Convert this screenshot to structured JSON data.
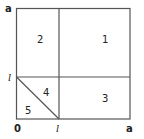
{
  "diagram": {
    "type": "partitioned-square",
    "colors": {
      "line": "#555555",
      "text": "#222222",
      "background": "#ffffff"
    },
    "axis_labels": {
      "y_top": "a",
      "y_mid": "l",
      "origin": "0",
      "x_mid": "l",
      "x_right": "a"
    },
    "regions": [
      {
        "id": "1",
        "label": "1"
      },
      {
        "id": "2",
        "label": "2"
      },
      {
        "id": "3",
        "label": "3"
      },
      {
        "id": "4",
        "label": "4"
      },
      {
        "id": "5",
        "label": "5"
      }
    ]
  }
}
